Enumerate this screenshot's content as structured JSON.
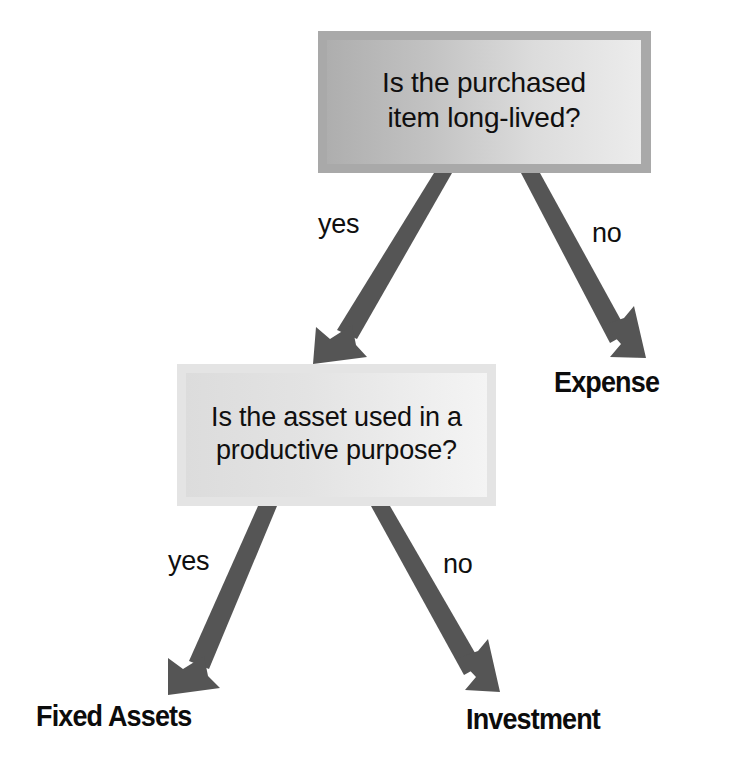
{
  "diagram": {
    "type": "decision-tree",
    "orientation": "top-down",
    "background_color": "#ffffff",
    "arrow_color": "#555555",
    "text_color": "#0f0f0f",
    "nodes": [
      {
        "id": "question-1",
        "kind": "decision",
        "text": "Is the purchased\nitem long-lived?",
        "line1": "Is the purchased",
        "line2": "item long-lived?",
        "fill_from": "#aeaeae",
        "fill_to": "#ececec",
        "border_color": "#a9a9a9"
      },
      {
        "id": "question-2",
        "kind": "decision",
        "text": "Is the asset used in a\nproductive purpose?",
        "line1": "Is the asset used in a",
        "line2": "productive purpose?",
        "fill_from": "#dcdcdc",
        "fill_to": "#f4f4f4",
        "border_color": "#e4e4e4"
      },
      {
        "id": "outcome-expense",
        "kind": "outcome",
        "text": "Expense"
      },
      {
        "id": "outcome-fixed-assets",
        "kind": "outcome",
        "text": "Fixed Assets"
      },
      {
        "id": "outcome-investment",
        "kind": "outcome",
        "text": "Investment"
      }
    ],
    "edges": [
      {
        "id": "edge-yes-1",
        "from": "question-1",
        "to": "question-2",
        "label": "yes"
      },
      {
        "id": "edge-no-1",
        "from": "question-1",
        "to": "outcome-expense",
        "label": "no"
      },
      {
        "id": "edge-yes-2",
        "from": "question-2",
        "to": "outcome-fixed-assets",
        "label": "yes"
      },
      {
        "id": "edge-no-2",
        "from": "question-2",
        "to": "outcome-investment",
        "label": "no"
      }
    ]
  }
}
